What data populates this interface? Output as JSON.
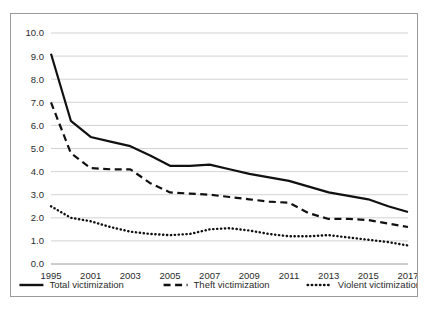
{
  "chart_data": {
    "type": "line",
    "title": "",
    "subtitle": "",
    "xlabel": "",
    "ylabel": "",
    "xlim": [
      1995,
      2017
    ],
    "ylim": [
      0.0,
      10.0
    ],
    "grid": true,
    "legend_position": "bottom",
    "x": [
      1995,
      2000,
      2001,
      2002,
      2003,
      2004,
      2005,
      2006,
      2007,
      2008,
      2009,
      2010,
      2011,
      2012,
      2013,
      2014,
      2015,
      2016,
      2017
    ],
    "xtick_labels": [
      "1995",
      "2001",
      "2003",
      "2005",
      "2007",
      "2009",
      "2011",
      "2013",
      "2015",
      "2017"
    ],
    "xtick_values": [
      1995,
      2001,
      2003,
      2005,
      2007,
      2009,
      2011,
      2013,
      2015,
      2017
    ],
    "ytick_labels": [
      "0.0",
      "1.0",
      "2.0",
      "3.0",
      "4.0",
      "5.0",
      "6.0",
      "7.0",
      "8.0",
      "9.0",
      "10.0"
    ],
    "ytick_values": [
      0.0,
      1.0,
      2.0,
      3.0,
      4.0,
      5.0,
      6.0,
      7.0,
      8.0,
      9.0,
      10.0
    ],
    "series": [
      {
        "name": "Total victimization",
        "style": "solid",
        "color": "#111111",
        "values": [
          9.1,
          6.2,
          5.5,
          5.3,
          5.1,
          4.7,
          4.25,
          4.25,
          4.3,
          4.1,
          3.9,
          3.75,
          3.6,
          3.35,
          3.1,
          2.95,
          2.8,
          2.5,
          2.25
        ]
      },
      {
        "name": "Theft victimization",
        "style": "dashed",
        "color": "#111111",
        "values": [
          7.0,
          4.8,
          4.15,
          4.1,
          4.1,
          3.5,
          3.1,
          3.05,
          3.0,
          2.9,
          2.8,
          2.7,
          2.65,
          2.2,
          1.95,
          1.95,
          1.9,
          1.75,
          1.6
        ]
      },
      {
        "name": "Violent victimization",
        "style": "dotted",
        "color": "#111111",
        "values": [
          2.5,
          2.0,
          1.85,
          1.6,
          1.4,
          1.3,
          1.25,
          1.3,
          1.5,
          1.55,
          1.45,
          1.3,
          1.2,
          1.2,
          1.25,
          1.15,
          1.05,
          0.95,
          0.8
        ]
      }
    ]
  },
  "legend": {
    "items": [
      {
        "label": "Total victimization"
      },
      {
        "label": "Theft victimization"
      },
      {
        "label": "Violent victimization"
      }
    ]
  }
}
